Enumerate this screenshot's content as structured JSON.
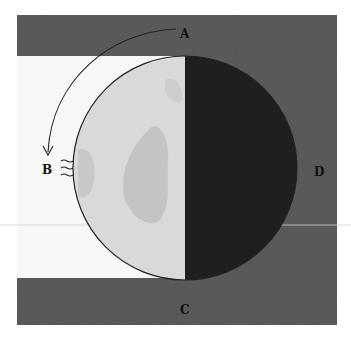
{
  "figure": {
    "labels": {
      "a": "A",
      "b": "B",
      "c": "C",
      "d": "D"
    },
    "colors": {
      "background": "#ffffff",
      "shadow_band": "#5b5b5b",
      "lit_region": "#f7f7f5",
      "moon_lit": "#d9d9d7",
      "moon_mare": "#c2c2c0",
      "moon_dark": "#1f1f1f",
      "outline": "#222222"
    },
    "geometry": {
      "frame": {
        "x": 17,
        "y": 15,
        "width": 320,
        "height": 310
      },
      "top_band_height": 41,
      "bottom_band_top": 278,
      "moon_center": {
        "x": 185,
        "y": 168
      },
      "moon_radius": 112,
      "terminator_x": 185
    },
    "annotations": {
      "arrow": "curved arrow from A toward B indicating direction of motion",
      "rays": "three wavy strokes at B indicating incoming light"
    }
  }
}
